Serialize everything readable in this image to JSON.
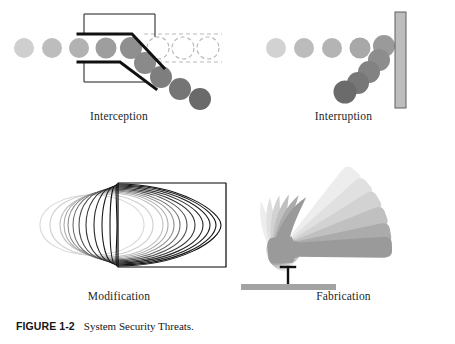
{
  "figure": {
    "caption_number": "FIGURE 1-2",
    "caption_title": "System Security Threats.",
    "background_color": "#ffffff",
    "ink_color": "#1a1a1a"
  },
  "panels": [
    {
      "id": "interception",
      "label": "Interception",
      "description": "A row of circles travelling left to right is tapped off by a diverting switch; the originals continue as dashed ghost outlines while copies fall away diagonally.",
      "stream": {
        "circle_radius": 10,
        "circle_count_incoming": 5,
        "incoming_colors": [
          "#cfcfcf",
          "#bdbdbd",
          "#b2b2b2",
          "#9e9e9e",
          "#8f8f8f"
        ],
        "ghost_count": 3,
        "ghost_stroke": "#b9b9b9",
        "diverted_count": 4,
        "diverted_colors": [
          "#8a8a8a",
          "#7e7e7e",
          "#747474",
          "#6a6a6a"
        ]
      },
      "switch": {
        "outline_color": "#1a1a1a",
        "thin_stroke_width": 1,
        "thick_stroke_width": 3,
        "channel_dash_color": "#b9b9b9"
      }
    },
    {
      "id": "interruption",
      "label": "Interruption",
      "description": "A row of circles travelling left to right is stopped by a vertical barrier and deflected downward into a pile.",
      "stream": {
        "circle_radius": 10,
        "circle_count_incoming": 4,
        "incoming_colors": [
          "#d2d2d2",
          "#bcbcbc",
          "#b4b4b4",
          "#a8a8a8"
        ],
        "deflected_count": 5,
        "deflected_colors": [
          "#9a9a9a",
          "#8d8d8d",
          "#828282",
          "#777777",
          "#6b6b6b"
        ]
      },
      "barrier": {
        "fill": "#bdbdbd",
        "stroke": "#5f5f5f",
        "width": 11,
        "height": 96
      }
    },
    {
      "id": "modification",
      "label": "Modification",
      "description": "A circle is progressively morphed, outline by outline, into a rectangle; early outlines are pale gray and later outlines are black.",
      "morph": {
        "steps": 13,
        "start_shape": "circle",
        "end_shape": "rectangle",
        "start_stroke": "#cccccc",
        "end_stroke": "#111111"
      }
    },
    {
      "id": "fabrication",
      "label": "Fabrication",
      "description": "A claw hammer swings down in a motion-blurred arc and strikes a nail driven into a flat gray block.",
      "hammer": {
        "ghost_count": 5,
        "darkest_fill": "#9a9a9a",
        "lightest_fill": "#ececec"
      },
      "nail": {
        "stroke": "#111111",
        "head_width": 14
      },
      "block": {
        "fill": "#a3a3a3",
        "width": 95,
        "height": 14
      }
    }
  ]
}
